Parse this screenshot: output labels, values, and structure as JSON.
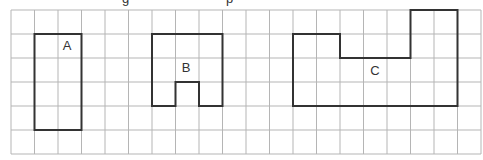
{
  "header": {
    "cut_off_text_fragments": [
      "g",
      "p"
    ]
  },
  "grid": {
    "origin_x": 11,
    "origin_y": 10,
    "cell_w": 23.5,
    "cell_h": 24,
    "cols": 20,
    "rows": 6,
    "line_color": "#b5b5b5"
  },
  "shapes": [
    {
      "id": "A",
      "label": "A",
      "outline_color": "#333333",
      "cells_path": [
        [
          1,
          1
        ],
        [
          3,
          1
        ],
        [
          3,
          5
        ],
        [
          1,
          5
        ]
      ],
      "label_pos": [
        67,
        50
      ]
    },
    {
      "id": "B",
      "label": "B",
      "outline_color": "#333333",
      "cells_path": [
        [
          6,
          1
        ],
        [
          9,
          1
        ],
        [
          9,
          4
        ],
        [
          8,
          4
        ],
        [
          8,
          3
        ],
        [
          7,
          3
        ],
        [
          7,
          4
        ],
        [
          6,
          4
        ]
      ],
      "label_pos": [
        186,
        72
      ]
    },
    {
      "id": "C",
      "label": "C",
      "outline_color": "#333333",
      "cells_path": [
        [
          12,
          1
        ],
        [
          14,
          1
        ],
        [
          14,
          2
        ],
        [
          17,
          2
        ],
        [
          17,
          0
        ],
        [
          19,
          0
        ],
        [
          19,
          4
        ],
        [
          12,
          4
        ]
      ],
      "label_pos": [
        375,
        75
      ]
    }
  ]
}
